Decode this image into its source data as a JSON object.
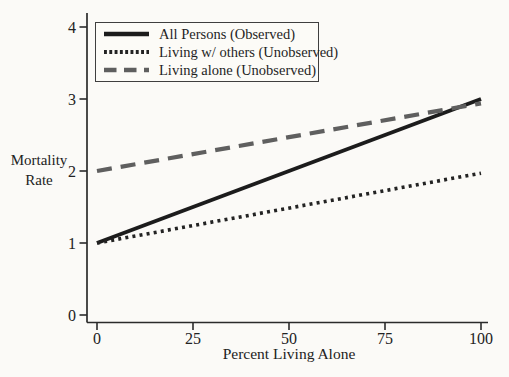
{
  "chart_data": {
    "type": "line",
    "title": "",
    "xlabel": "Percent Living Alone",
    "ylabel": "Mortality Rate",
    "ylabel_lines": [
      "Mortality",
      "Rate"
    ],
    "xlim": [
      0,
      100
    ],
    "ylim": [
      0,
      4
    ],
    "x_ticks": [
      "0",
      "25",
      "50",
      "75",
      "100"
    ],
    "y_ticks": [
      "0",
      "1",
      "2",
      "3",
      "4"
    ],
    "grid": false,
    "legend_position": "top-left-inside",
    "series": [
      {
        "name": "All Persons (Observed)",
        "line_style": "solid",
        "color": "#1c1c1c",
        "x": [
          0,
          100
        ],
        "y": [
          1,
          3
        ]
      },
      {
        "name": "Living w/ others (Unobserved)",
        "line_style": "dotted",
        "color": "#232323",
        "x": [
          0,
          100
        ],
        "y": [
          1,
          1.97
        ]
      },
      {
        "name": "Living alone (Unobserved)",
        "line_style": "dashed",
        "color": "#5f5f5f",
        "x": [
          0,
          100
        ],
        "y": [
          2,
          2.94
        ]
      }
    ]
  },
  "colors": {
    "background": "#fbfaf7",
    "axis": "#2b2b2b",
    "text": "#222222",
    "legend_border": "#3f3f3f"
  }
}
